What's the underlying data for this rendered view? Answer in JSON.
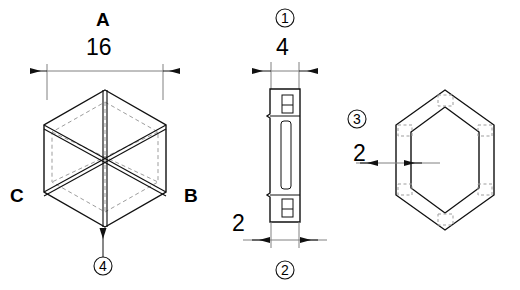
{
  "drawing": {
    "title": "Hexagonal insert three-view technical drawing",
    "background_color": "#ffffff",
    "line_color": "#1a1a1a",
    "hidden_line_color": "#9a9a9a",
    "dimension_line_color": "#6e6e6e"
  },
  "views": {
    "isometric": {
      "name": "isometric-hex-view",
      "face_labels": [
        {
          "id": "A",
          "text": "A",
          "x": 96,
          "y": 10
        },
        {
          "id": "B",
          "text": "B",
          "x": 184,
          "y": 186
        },
        {
          "id": "C",
          "text": "C",
          "x": 10,
          "y": 186
        }
      ],
      "dimension": {
        "value": "16",
        "label_x": 86,
        "label_y": 36,
        "line_y": 71,
        "from_x": 47,
        "to_x": 163
      },
      "balloon": {
        "number": "4",
        "cx": 103,
        "cy": 266,
        "r": 9
      }
    },
    "side": {
      "name": "side-section-view",
      "top_dimension": {
        "value": "4",
        "label_x": 276,
        "label_y": 36,
        "line_y": 71,
        "from_x": 271,
        "to_x": 299
      },
      "bottom_dimension": {
        "value": "2",
        "label_x": 232,
        "label_y": 212,
        "line_y": 240,
        "from_x": 271,
        "to_x": 299
      },
      "balloon_top": {
        "number": "1",
        "cx": 285,
        "cy": 18,
        "r": 9
      },
      "balloon_bottom": {
        "number": "2",
        "cx": 285,
        "cy": 270,
        "r": 9
      }
    },
    "front": {
      "name": "front-hex-ring-view",
      "wall_dimension": {
        "value": "2",
        "label_x": 353,
        "label_y": 142,
        "line_y": 163,
        "from_x": 360,
        "to_x": 404
      },
      "balloon": {
        "number": "3",
        "cx": 357,
        "cy": 119,
        "r": 9
      }
    }
  }
}
